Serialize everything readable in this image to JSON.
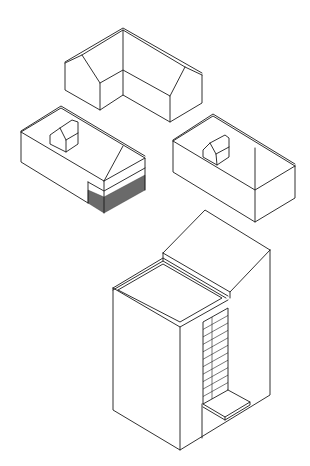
{
  "diagram": {
    "stroke_color": "#1a1a1a",
    "hatch_color": "#6a6a6a",
    "background": "#ffffff",
    "buildings": [
      {
        "id": "l-shaped-gabled-house",
        "position": "top-center",
        "lines": [
          [
            [
              65,
              63
            ],
            [
              82,
              55
            ],
            [
              123,
              30
            ],
            [
              185,
              67
            ],
            [
              202,
              75
            ]
          ],
          [
            [
              65,
              62
            ],
            [
              123,
              28
            ],
            [
              202,
              73
            ]
          ],
          [
            [
              65,
              63
            ],
            [
              65,
              90
            ],
            [
              100,
              110
            ],
            [
              123,
              95
            ],
            [
              170,
              122
            ],
            [
              202,
              103
            ],
            [
              202,
              75
            ]
          ],
          [
            [
              82,
              55
            ],
            [
              100,
              83
            ],
            [
              100,
              110
            ]
          ],
          [
            [
              100,
              83
            ],
            [
              123,
              70
            ],
            [
              170,
              96
            ],
            [
              170,
              122
            ]
          ],
          [
            [
              123,
              30
            ],
            [
              123,
              95
            ]
          ],
          [
            [
              185,
              67
            ],
            [
              170,
              96
            ]
          ]
        ]
      },
      {
        "id": "house-with-dormer-and-carport",
        "position": "middle-left",
        "lines": [
          [
            [
              21,
              132
            ],
            [
              61,
              108
            ],
            [
              145,
              158
            ]
          ],
          [
            [
              21,
              131
            ],
            [
              61,
              106
            ],
            [
              145,
              156
            ]
          ],
          [
            [
              21,
              132
            ],
            [
              21,
              162
            ],
            [
              88,
              203
            ]
          ],
          [
            [
              21,
              132
            ],
            [
              104,
              181
            ],
            [
              145,
              158
            ],
            [
              145,
              190
            ]
          ],
          [
            [
              104,
              181
            ],
            [
              123,
              146
            ]
          ],
          [
            [
              88,
              182
            ],
            [
              88,
              203
            ]
          ],
          [
            [
              88,
              182
            ],
            [
              104,
              191
            ],
            [
              145,
              168
            ]
          ],
          [
            [
              104,
              181
            ],
            [
              104,
              213
            ]
          ]
        ],
        "dormer": [
          [
            [
              50,
              135
            ],
            [
              60,
              128
            ],
            [
              72,
              120
            ],
            [
              78,
              122
            ],
            [
              78,
              144
            ],
            [
              66,
              152
            ],
            [
              50,
              144
            ],
            [
              50,
              135
            ]
          ],
          [
            [
              60,
              128
            ],
            [
              66,
              140
            ],
            [
              66,
              152
            ]
          ],
          [
            [
              66,
              140
            ],
            [
              78,
              133
            ]
          ]
        ],
        "hatched_area": [
          [
            88,
            203
          ],
          [
            104,
            213
          ],
          [
            145,
            190
          ],
          [
            145,
            175
          ],
          [
            104,
            197
          ],
          [
            88,
            190
          ]
        ]
      },
      {
        "id": "house-with-dormer",
        "position": "middle-right",
        "lines": [
          [
            [
              173,
              141
            ],
            [
              213,
              116
            ],
            [
              295,
              166
            ]
          ],
          [
            [
              173,
              140
            ],
            [
              213,
              114
            ],
            [
              295,
              164
            ]
          ],
          [
            [
              173,
              141
            ],
            [
              173,
              172
            ],
            [
              255,
              222
            ],
            [
              295,
              198
            ],
            [
              295,
              166
            ]
          ],
          [
            [
              173,
              141
            ],
            [
              255,
              190
            ],
            [
              295,
              166
            ]
          ],
          [
            [
              255,
              148
            ],
            [
              255,
              222
            ]
          ]
        ],
        "dormer": [
          [
            [
              203,
              150
            ],
            [
              210,
              143
            ],
            [
              225,
              135
            ],
            [
              229,
              138
            ],
            [
              229,
              157
            ],
            [
              217,
              165
            ],
            [
              203,
              157
            ],
            [
              203,
              150
            ]
          ],
          [
            [
              210,
              143
            ],
            [
              216,
              154
            ],
            [
              217,
              165
            ]
          ],
          [
            [
              216,
              154
            ],
            [
              229,
              147
            ]
          ]
        ]
      },
      {
        "id": "tower-house-with-shed-roof",
        "position": "bottom-center",
        "lines": [
          [
            [
              113,
              288
            ],
            [
              163,
              258
            ],
            [
              228,
              296
            ]
          ],
          [
            [
              113,
              290
            ],
            [
              163,
              261
            ],
            [
              226,
              298
            ]
          ],
          [
            [
              118,
              290
            ],
            [
              163,
              264
            ],
            [
              222,
              298
            ],
            [
              180,
              322
            ],
            [
              118,
              290
            ]
          ],
          [
            [
              113,
              288
            ],
            [
              180,
              327
            ],
            [
              228,
              300
            ]
          ],
          [
            [
              163,
              253
            ],
            [
              205,
              210
            ],
            [
              270,
              250
            ]
          ],
          [
            [
              163,
              253
            ],
            [
              163,
              261
            ]
          ],
          [
            [
              163,
              253
            ],
            [
              230,
              292
            ],
            [
              270,
              250
            ]
          ],
          [
            [
              230,
              292
            ],
            [
              230,
              298
            ]
          ],
          [
            [
              113,
              288
            ],
            [
              113,
              410
            ],
            [
              180,
              450
            ],
            [
              270,
              395
            ],
            [
              270,
              250
            ]
          ],
          [
            [
              180,
              327
            ],
            [
              180,
              450
            ]
          ]
        ],
        "window": {
          "frame": [
            [
              203,
              322
            ],
            [
              228,
              308
            ],
            [
              228,
              390
            ],
            [
              203,
              404
            ],
            [
              203,
              322
            ]
          ],
          "mullion": [
            [
              212,
              317
            ],
            [
              212,
              399
            ]
          ],
          "rails": 11
        },
        "step": [
          [
            [
              203,
              404
            ],
            [
              225,
              417
            ],
            [
              250,
              402
            ],
            [
              228,
              390
            ]
          ],
          [
            [
              203,
              407
            ],
            [
              225,
              420
            ],
            [
              250,
              405
            ],
            [
              250,
              402
            ]
          ],
          [
            [
              225,
              417
            ],
            [
              225,
              420
            ]
          ]
        ],
        "inner_wall": [
          [
            202,
            404
          ],
          [
            202,
            438
          ]
        ]
      }
    ]
  }
}
